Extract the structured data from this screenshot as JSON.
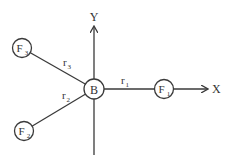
{
  "diagram": {
    "axes": {
      "x_label": "X",
      "y_label": "Y"
    },
    "center_node": {
      "label": "B"
    },
    "nodes": [
      {
        "id": "F1",
        "base": "F",
        "sub": "1",
        "edge_label_base": "r",
        "edge_label_sub": "1"
      },
      {
        "id": "F2",
        "base": "F",
        "sub": "2",
        "edge_label_base": "r",
        "edge_label_sub": "2"
      },
      {
        "id": "F3",
        "base": "F",
        "sub": "3",
        "edge_label_base": "r",
        "edge_label_sub": "3"
      }
    ],
    "colors": {
      "stroke": "#3a3a3a",
      "text": "#333333",
      "background": "#ffffff"
    }
  }
}
